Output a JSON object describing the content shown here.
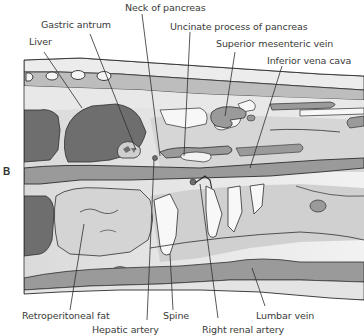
{
  "figure": {
    "panel_letter": "B",
    "labels": {
      "neck_of_pancreas": "Neck of pancreas",
      "gastric_antrum": "Gastric antrum",
      "uncinate_process": "Uncinate process of pancreas",
      "liver": "Liver",
      "superior_mesenteric_vein": "Superior mesenteric vein",
      "inferior_vena_cava": "Inferior vena cava",
      "retroperitoneal_fat": "Retroperitoneal fat",
      "spine": "Spine",
      "lumbar_vein": "Lumbar vein",
      "hepatic_artery": "Hepatic artery",
      "right_renal_artery": "Right renal artery"
    },
    "colors": {
      "dark_tissue": "#6e6e6e",
      "mid_tissue": "#9a9a9a",
      "light_tissue": "#cfcfcf",
      "pale_tissue": "#e4e4e4",
      "white_fluid": "#f7f7f7",
      "outline": "#2e2e2e",
      "text": "#3a3a3a"
    }
  }
}
